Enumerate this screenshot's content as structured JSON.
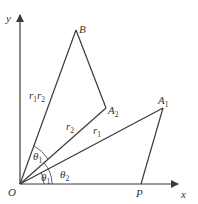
{
  "diagram": {
    "type": "geometry-vector-rotation",
    "axes": {
      "x_label": "x",
      "y_label": "y",
      "origin_label": "O"
    },
    "points": {
      "B": {
        "label": "B"
      },
      "A2": {
        "label": "A",
        "sub": "2"
      },
      "A1": {
        "label": "A",
        "sub": "1"
      },
      "P": {
        "label": "P"
      }
    },
    "segment_labels": {
      "OB": {
        "label": "r",
        "sub1": "1",
        "label2": "r",
        "sub2": "2"
      },
      "OA2": {
        "label": "r",
        "sub": "2"
      },
      "OA1": {
        "label": "r",
        "sub": "1"
      }
    },
    "angle_labels": {
      "upper_theta1": {
        "label": "θ",
        "sub": "1"
      },
      "lower_theta1": {
        "label": "θ",
        "sub": "1"
      },
      "theta2": {
        "label": "θ",
        "sub": "2"
      }
    },
    "colors": {
      "line": "#3a3a3a",
      "text": "#333333",
      "background": "#ffffff"
    }
  }
}
